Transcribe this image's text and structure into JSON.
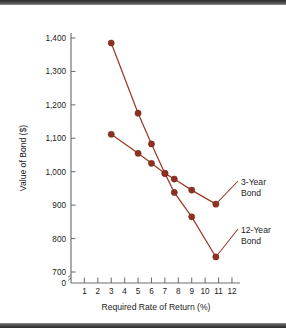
{
  "chart_data": {
    "type": "line",
    "title": "",
    "xlabel": "Required Rate of Return (%)",
    "ylabel": "Value of Bond ($)",
    "xlim": [
      0,
      12.6
    ],
    "ylim": [
      700,
      1400
    ],
    "y_axis_break": true,
    "y_break_base_label": "0",
    "grid": false,
    "legend_position": "right-inline",
    "x_ticks": [
      1,
      2,
      3,
      4,
      5,
      6,
      7,
      8,
      9,
      10,
      11,
      12
    ],
    "x_tick_labels": [
      "1",
      "2",
      "3",
      "4",
      "5",
      "6",
      "7",
      "8",
      "9",
      "10",
      "11",
      "12"
    ],
    "y_ticks": [
      700,
      800,
      900,
      1000,
      1100,
      1200,
      1300,
      1400
    ],
    "y_tick_labels": [
      "700",
      "800",
      "900",
      "1,000",
      "1,100",
      "1,200",
      "1,300",
      "1,400"
    ],
    "origin_label": "0",
    "series": [
      {
        "name": "12-Year Bond",
        "label": "12-Year",
        "label_line2": "Bond",
        "color": "#9c3a28",
        "x": [
          3,
          5,
          6,
          7,
          7.7,
          9,
          10.8
        ],
        "values": [
          1385,
          1175,
          1083,
          995,
          938,
          865,
          745
        ]
      },
      {
        "name": "3-Year Bond",
        "label": "3-Year",
        "label_line2": "Bond",
        "color": "#9c3a28",
        "x": [
          3,
          5,
          6,
          7,
          7.7,
          9,
          10.8
        ],
        "values": [
          1112,
          1055,
          1025,
          995,
          978,
          945,
          903
        ]
      }
    ]
  },
  "colors": {
    "series": "#9c3a28",
    "marker": "#8f3122",
    "axis": "#6e6e6e",
    "text": "#1b1b1b",
    "background": "#ffffff",
    "edge_band": "#2e2e2e"
  }
}
